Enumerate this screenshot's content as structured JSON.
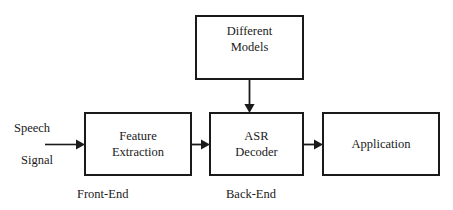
{
  "diagram": {
    "type": "block-diagram",
    "stroke_color": "#1a1a1a",
    "background_color": "#ffffff",
    "nodes": [
      {
        "id": "models",
        "label": "Different Models",
        "lines": [
          "Different",
          "Models"
        ],
        "shape": "rectangle"
      },
      {
        "id": "feature_extraction",
        "label": "Feature Extraction",
        "lines": [
          "Feature",
          "Extraction"
        ],
        "shape": "rectangle"
      },
      {
        "id": "asr_decoder",
        "label": "ASR Decoder",
        "lines": [
          "ASR",
          "Decoder"
        ],
        "shape": "rectangle"
      },
      {
        "id": "application",
        "label": "Application",
        "lines": [
          "Application"
        ],
        "shape": "rectangle"
      }
    ],
    "labels": {
      "input_line1": "Speech",
      "input_line2": "Signal",
      "front_end": "Front-End",
      "back_end": "Back-End"
    },
    "connectors": [
      {
        "id": "input-to-feature",
        "from": "Speech Signal",
        "to": "feature_extraction",
        "direction": "right"
      },
      {
        "id": "feature-to-asr",
        "from": "feature_extraction",
        "to": "asr_decoder",
        "direction": "right"
      },
      {
        "id": "asr-to-application",
        "from": "asr_decoder",
        "to": "application",
        "direction": "right"
      },
      {
        "id": "models-to-asr",
        "from": "models",
        "to": "asr_decoder",
        "direction": "down"
      }
    ]
  }
}
